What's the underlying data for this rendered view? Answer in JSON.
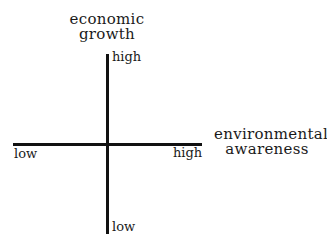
{
  "diagram": {
    "type": "quadrant-axes",
    "colors": {
      "axis": "#111111",
      "text": "#1a1a1a",
      "background": "#ffffff"
    },
    "vertical_axis": {
      "title_line1": "economic",
      "title_line2": "growth",
      "high_label": "high",
      "low_label": "low"
    },
    "horizontal_axis": {
      "title_line1": "environmental",
      "title_line2": "awareness",
      "high_label": "high",
      "low_label": "low"
    }
  }
}
